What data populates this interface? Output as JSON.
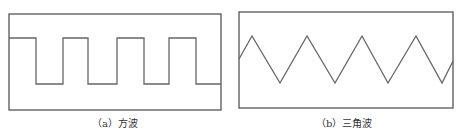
{
  "panels": [
    {
      "id": "a",
      "caption": "（a）方波",
      "wave_type": "square",
      "frame": {
        "x": 9,
        "y": 14,
        "w": 212,
        "h": 96
      },
      "points": [
        [
          9,
          38
        ],
        [
          36,
          38
        ],
        [
          36,
          84
        ],
        [
          63,
          84
        ],
        [
          63,
          38
        ],
        [
          88,
          38
        ],
        [
          88,
          84
        ],
        [
          117,
          84
        ],
        [
          117,
          38
        ],
        [
          144,
          38
        ],
        [
          144,
          84
        ],
        [
          169,
          84
        ],
        [
          169,
          38
        ],
        [
          196,
          38
        ],
        [
          196,
          84
        ],
        [
          221,
          84
        ]
      ]
    },
    {
      "id": "b",
      "caption": "（b）三角波",
      "wave_type": "triangle",
      "frame": {
        "x": 239,
        "y": 12,
        "w": 214,
        "h": 96
      },
      "points": [
        [
          239,
          59
        ],
        [
          252,
          36
        ],
        [
          280,
          83
        ],
        [
          307,
          36
        ],
        [
          335,
          83
        ],
        [
          362,
          36
        ],
        [
          388,
          83
        ],
        [
          416,
          36
        ],
        [
          442,
          83
        ],
        [
          453,
          61
        ]
      ]
    }
  ],
  "colors": {
    "line": "#666666",
    "frame": "#555555"
  }
}
